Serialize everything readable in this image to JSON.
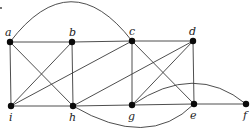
{
  "diagram": {
    "type": "graph",
    "directed": false,
    "stray_mark": {
      "x": 1,
      "y": 8
    },
    "nodes": [
      {
        "id": "a",
        "label": "a",
        "x": 10,
        "y": 42,
        "lx": 5,
        "ly": 36
      },
      {
        "id": "b",
        "label": "b",
        "x": 72,
        "y": 42,
        "lx": 69,
        "ly": 36
      },
      {
        "id": "c",
        "label": "c",
        "x": 132,
        "y": 41,
        "lx": 129,
        "ly": 35
      },
      {
        "id": "d",
        "label": "d",
        "x": 193,
        "y": 41,
        "lx": 189,
        "ly": 35
      },
      {
        "id": "i",
        "label": "i",
        "x": 11,
        "y": 106,
        "lx": 9,
        "ly": 121
      },
      {
        "id": "h",
        "label": "h",
        "x": 73,
        "y": 106,
        "lx": 69,
        "ly": 121
      },
      {
        "id": "g",
        "label": "g",
        "x": 132,
        "y": 105,
        "lx": 128,
        "ly": 120
      },
      {
        "id": "e",
        "label": "e",
        "x": 194,
        "y": 104,
        "lx": 190,
        "ly": 119
      },
      {
        "id": "f",
        "label": "f",
        "x": 246,
        "y": 104,
        "lx": 243,
        "ly": 119
      }
    ],
    "edges": [
      {
        "from": "a",
        "to": "b"
      },
      {
        "from": "b",
        "to": "c"
      },
      {
        "from": "c",
        "to": "d"
      },
      {
        "from": "i",
        "to": "h"
      },
      {
        "from": "h",
        "to": "g"
      },
      {
        "from": "g",
        "to": "e"
      },
      {
        "from": "e",
        "to": "f"
      },
      {
        "from": "a",
        "to": "i"
      },
      {
        "from": "b",
        "to": "h"
      },
      {
        "from": "c",
        "to": "g"
      },
      {
        "from": "d",
        "to": "e"
      },
      {
        "from": "a",
        "to": "h"
      },
      {
        "from": "b",
        "to": "i"
      },
      {
        "from": "c",
        "to": "i"
      },
      {
        "from": "d",
        "to": "h"
      },
      {
        "from": "c",
        "to": "e"
      },
      {
        "from": "d",
        "to": "g"
      },
      {
        "from": "a",
        "to": "c",
        "curve": {
          "cx": 71,
          "cy": -38
        }
      },
      {
        "from": "h",
        "to": "e",
        "curve": {
          "cx": 148,
          "cy": 150
        }
      },
      {
        "from": "g",
        "to": "f",
        "curve": {
          "cx": 195,
          "cy": 62
        }
      }
    ]
  }
}
